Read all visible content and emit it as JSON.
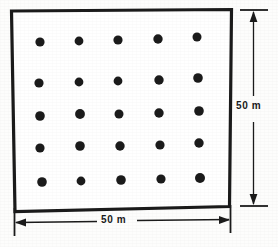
{
  "figure": {
    "plot": {
      "shape": "square",
      "width_label": "50 m",
      "height_label": "50 m",
      "stroke_color": "#1b1b1b",
      "fill_color": "#ffffff",
      "corners": [
        {
          "name": "top-left",
          "x": 11,
          "y": 11
        },
        {
          "name": "top-right",
          "x": 231,
          "y": 9
        },
        {
          "name": "bottom-right",
          "x": 229,
          "y": 206
        },
        {
          "name": "bottom-left",
          "x": 15,
          "y": 211
        }
      ]
    },
    "sample_points": {
      "count": 25,
      "rows": 5,
      "columns": 5,
      "color": "#1b1b1b",
      "radius": 4.4,
      "column_x": [
        40,
        80,
        119,
        159,
        199
      ],
      "row_y": [
        42,
        82,
        114,
        147,
        181
      ]
    },
    "dimensions": [
      {
        "name": "vertical-dimension",
        "label": "50 m",
        "orientation": "vertical",
        "line_x": 253,
        "start_y": 12,
        "end_y": 204,
        "tick_start_y": 10,
        "tick_end_y": 206
      },
      {
        "name": "horizontal-dimension",
        "label": "50 m",
        "orientation": "horizontal",
        "line_y": 222,
        "start_x": 16,
        "end_x": 228,
        "tick_start_x": 14,
        "tick_end_x": 230
      }
    ]
  }
}
